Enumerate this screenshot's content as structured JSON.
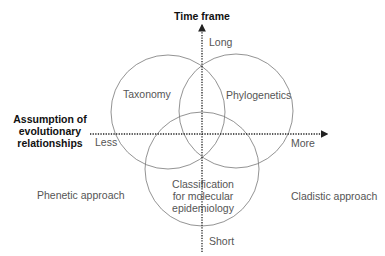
{
  "diagram": {
    "axes": {
      "vertical": {
        "title": "Time frame",
        "top_label": "Long",
        "bottom_label": "Short"
      },
      "horizontal": {
        "title_lines": [
          "Assumption of",
          "evolutionary",
          "relationships"
        ],
        "left_label": "Less",
        "right_label": "More"
      }
    },
    "circles": [
      {
        "id": "taxonomy",
        "label": "Taxonomy"
      },
      {
        "id": "phylogenetics",
        "label": "Phylogenetics"
      },
      {
        "id": "classification",
        "label_lines": [
          "Classification",
          "for molecular",
          "epidemiology"
        ]
      }
    ],
    "side_labels": {
      "left": "Phenetic approach",
      "right": "Cladistic approach"
    },
    "colors": {
      "circle_stroke": "#777777",
      "axis": "#222222",
      "text": "#555555",
      "title": "#111111"
    }
  }
}
